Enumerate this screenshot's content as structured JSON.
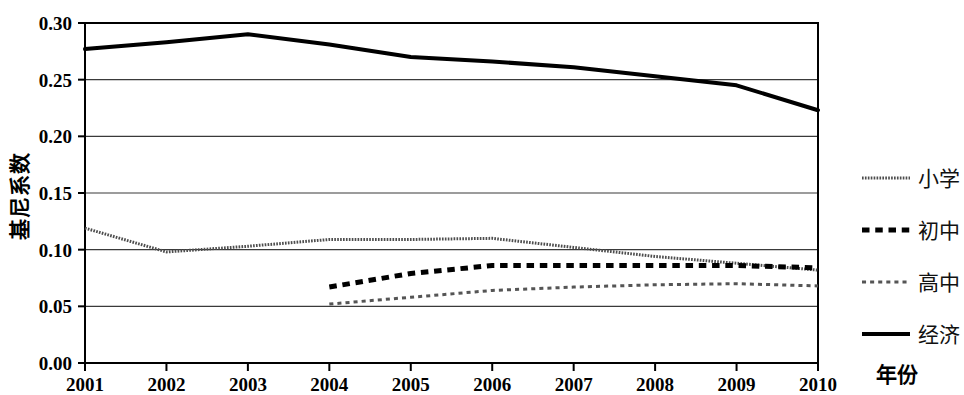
{
  "chart_data": {
    "type": "line",
    "title": "",
    "xlabel": "年份",
    "ylabel": "基尼系数",
    "x": [
      2001,
      2002,
      2003,
      2004,
      2005,
      2006,
      2007,
      2008,
      2009,
      2010
    ],
    "categories": [
      "2001",
      "2002",
      "2003",
      "2004",
      "2005",
      "2006",
      "2007",
      "2008",
      "2009",
      "2010"
    ],
    "xlim": [
      2001,
      2010
    ],
    "ylim": [
      0.0,
      0.3
    ],
    "yticks": [
      "0.00",
      "0.05",
      "0.10",
      "0.15",
      "0.20",
      "0.25",
      "0.30"
    ],
    "ytick_values": [
      0.0,
      0.05,
      0.1,
      0.15,
      0.2,
      0.25,
      0.3
    ],
    "grid": true,
    "grid_axis": "y",
    "legend_position": "right",
    "series": [
      {
        "name": "小学",
        "style": "fine-dotted-gray",
        "color": "#4d4d4d",
        "width": 3,
        "values": [
          0.119,
          0.098,
          0.103,
          0.109,
          0.109,
          0.11,
          0.102,
          0.094,
          0.088,
          0.082
        ]
      },
      {
        "name": "初中",
        "style": "thick-dashed",
        "color": "#000000",
        "width": 5,
        "values": [
          null,
          null,
          null,
          0.067,
          0.079,
          0.086,
          0.086,
          0.086,
          0.086,
          0.084
        ]
      },
      {
        "name": "高中",
        "style": "thin-dashed-gray",
        "color": "#555555",
        "width": 3,
        "values": [
          null,
          null,
          null,
          0.052,
          0.058,
          0.064,
          0.067,
          0.069,
          0.07,
          0.068
        ]
      },
      {
        "name": "经济",
        "style": "thick-solid",
        "color": "#000000",
        "width": 4,
        "values": [
          0.277,
          0.283,
          0.29,
          0.281,
          0.27,
          0.266,
          0.261,
          0.253,
          0.245,
          0.223
        ]
      }
    ]
  },
  "legend": {
    "items": [
      {
        "label": "小学"
      },
      {
        "label": "初中"
      },
      {
        "label": "高中"
      },
      {
        "label": "经济"
      }
    ]
  },
  "axes": {
    "y_title": "基尼系数",
    "x_title": "年份"
  }
}
